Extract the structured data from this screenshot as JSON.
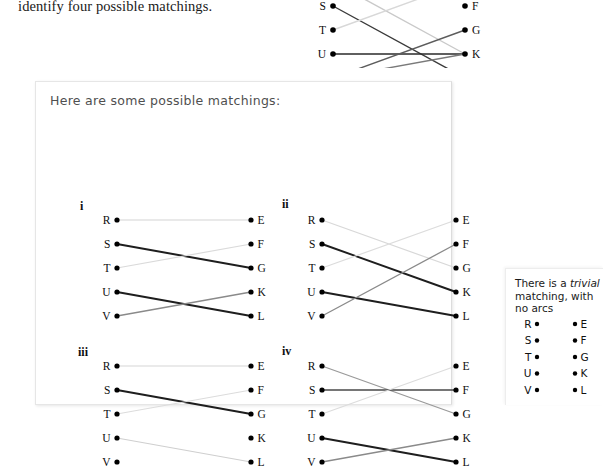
{
  "page": {
    "background": "#ffffff",
    "prose_line": "identify four possible matchings."
  },
  "top_figure": {
    "name": "clipped-bipartite-graph",
    "left_labels": [
      "R",
      "S",
      "T",
      "U",
      "V"
    ],
    "right_labels": [
      "E",
      "F",
      "G",
      "K",
      "L"
    ],
    "visible_left_labels": [
      "T",
      "U",
      "V"
    ],
    "visible_right_labels": [
      "G",
      "K",
      "L"
    ],
    "edges": [
      {
        "from": "R",
        "to": "K",
        "color": "#c9c9c9"
      },
      {
        "from": "S",
        "to": "L",
        "color": "#3a3a3a"
      },
      {
        "from": "T",
        "to": "E",
        "color": "#d8d8d8"
      },
      {
        "from": "U",
        "to": "K",
        "color": "#2b2b2b"
      },
      {
        "from": "V",
        "to": "G",
        "color": "#5c5c5c"
      },
      {
        "from": "V",
        "to": "K",
        "color": "#7a7a7a"
      }
    ]
  },
  "card": {
    "title": "Here are some possible matchings:",
    "figures": [
      {
        "id": "i",
        "numeral": "i",
        "left_labels": [
          "R",
          "S",
          "T",
          "U",
          "V"
        ],
        "right_labels": [
          "E",
          "F",
          "G",
          "K",
          "L"
        ],
        "edges": [
          {
            "from": "R",
            "to": "E",
            "color": "#d4d4d4",
            "width": 1.1
          },
          {
            "from": "S",
            "to": "G",
            "color": "#1e1e1e",
            "width": 2.0
          },
          {
            "from": "T",
            "to": "F",
            "color": "#dadada",
            "width": 1.2
          },
          {
            "from": "U",
            "to": "L",
            "color": "#1e1e1e",
            "width": 2.0
          },
          {
            "from": "V",
            "to": "K",
            "color": "#8a8a8a",
            "width": 1.3
          }
        ]
      },
      {
        "id": "ii",
        "numeral": "ii",
        "left_labels": [
          "R",
          "S",
          "T",
          "U",
          "V"
        ],
        "right_labels": [
          "E",
          "F",
          "G",
          "K",
          "L"
        ],
        "edges": [
          {
            "from": "R",
            "to": "G",
            "color": "#d8d8d8",
            "width": 1.2
          },
          {
            "from": "S",
            "to": "K",
            "color": "#1e1e1e",
            "width": 1.9
          },
          {
            "from": "T",
            "to": "E",
            "color": "#dcdcdc",
            "width": 1.2
          },
          {
            "from": "U",
            "to": "L",
            "color": "#1e1e1e",
            "width": 1.9
          },
          {
            "from": "V",
            "to": "F",
            "color": "#8a8a8a",
            "width": 1.3
          }
        ]
      },
      {
        "id": "iii",
        "numeral": "iii",
        "left_labels": [
          "R",
          "S",
          "T",
          "U",
          "V"
        ],
        "right_labels": [
          "E",
          "F",
          "G",
          "K",
          "L"
        ],
        "edges": [
          {
            "from": "R",
            "to": "E",
            "color": "#d6d6d6",
            "width": 1.1
          },
          {
            "from": "S",
            "to": "G",
            "color": "#1e1e1e",
            "width": 2.0
          },
          {
            "from": "T",
            "to": "F",
            "color": "#dcdcdc",
            "width": 1.2
          },
          {
            "from": "U",
            "to": "L",
            "color": "#cfcfcf",
            "width": 1.2
          }
        ]
      },
      {
        "id": "iv",
        "numeral": "iv",
        "left_labels": [
          "R",
          "S",
          "T",
          "U",
          "V"
        ],
        "right_labels": [
          "E",
          "F",
          "G",
          "K",
          "L"
        ],
        "edges": [
          {
            "from": "R",
            "to": "G",
            "color": "#9a9a9a",
            "width": 1.3
          },
          {
            "from": "S",
            "to": "F",
            "color": "#4a4a4a",
            "width": 1.5
          },
          {
            "from": "T",
            "to": "E",
            "color": "#dcdcdc",
            "width": 1.2
          },
          {
            "from": "U",
            "to": "L",
            "color": "#1e1e1e",
            "width": 2.0
          },
          {
            "from": "V",
            "to": "K",
            "color": "#8a8a8a",
            "width": 1.3
          }
        ]
      }
    ]
  },
  "side_card": {
    "text_line_1": "There is a ",
    "text_italic": "trivial",
    "text_line_2": "matching, with",
    "text_line_3": "no arcs",
    "left_labels": [
      "R",
      "S",
      "T",
      "U",
      "V"
    ],
    "right_labels": [
      "E",
      "F",
      "G",
      "K",
      "L"
    ],
    "edges": []
  },
  "colors": {
    "page_bg": "#ffffff",
    "card_bg": "#ffffff",
    "card_border": "#e6e6e6",
    "title_text": "#4f4f4f",
    "label_text": "#0d0d0d",
    "dot": "#000000"
  }
}
